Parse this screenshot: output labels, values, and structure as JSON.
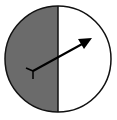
{
  "spinner": {
    "sections": [
      {
        "name": "left-half",
        "fill": "#6b6b6b"
      },
      {
        "name": "right-half",
        "fill": "#ffffff"
      }
    ],
    "outline_color": "#111111",
    "arrow_color": "#000000",
    "arrow_direction": "upper-right"
  }
}
